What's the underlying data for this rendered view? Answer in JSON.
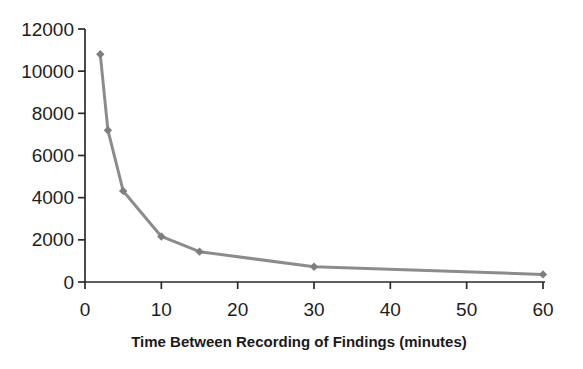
{
  "chart_data": {
    "type": "line",
    "x": [
      2,
      3,
      5,
      10,
      15,
      30,
      60
    ],
    "series": [
      {
        "name": "findings",
        "values": [
          10800,
          7200,
          4320,
          2160,
          1440,
          720,
          360
        ]
      }
    ],
    "title": "",
    "xlabel": "Time Between Recording of Findings (minutes)",
    "ylabel": "",
    "xlim": [
      0,
      60
    ],
    "ylim": [
      0,
      12000
    ],
    "x_ticks": [
      0,
      10,
      20,
      30,
      40,
      50,
      60
    ],
    "y_ticks": [
      0,
      2000,
      4000,
      6000,
      8000,
      10000,
      12000
    ],
    "grid": false,
    "legend": "none",
    "marker": "diamond",
    "colors": {
      "line": "#8c8c8c",
      "marker": "#7e7e7e",
      "axis": "#2a2a2a",
      "tick_text": "#1e1e1e",
      "title_text": "#1a1a1a",
      "background": "#ffffff"
    }
  }
}
